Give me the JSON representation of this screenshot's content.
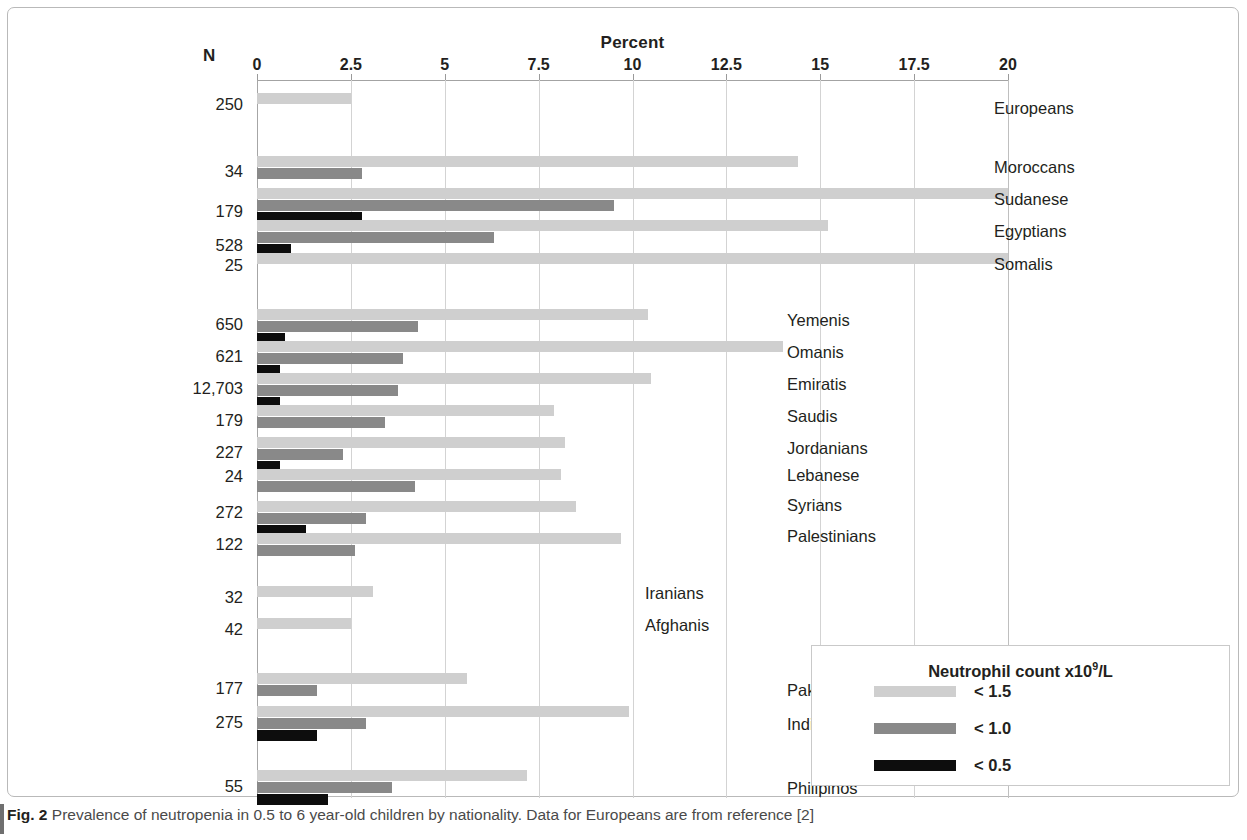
{
  "figure": {
    "caption_label": "Fig. 2",
    "caption_text": "Prevalence of neutropenia in 0.5 to 6 year-old children by nationality. Data for Europeans are from reference [2]"
  },
  "axis": {
    "title": "Percent",
    "n_header": "N",
    "tick_labels": [
      "0",
      "2.5",
      "5",
      "7.5",
      "10",
      "12.5",
      "15",
      "17.5",
      "20"
    ]
  },
  "legend": {
    "title_prefix": "Neutrophil count x10",
    "title_sup": "9",
    "title_suffix": "/L",
    "entries": [
      {
        "label": "< 1.5",
        "color": "#cfcfcf",
        "swatch_class": "sw15"
      },
      {
        "label": "< 1.0",
        "color": "#898989",
        "swatch_class": "sw10"
      },
      {
        "label": "< 0.5",
        "color": "#0d0d0d",
        "swatch_class": "sw05"
      }
    ]
  },
  "chart_data": {
    "type": "bar",
    "orientation": "horizontal",
    "title": "Prevalence of neutropenia in 0.5 to 6 year-old children by nationality",
    "xlabel": "Percent",
    "ylabel": "N",
    "xlim": [
      0,
      20
    ],
    "xticks": [
      0,
      2.5,
      5,
      7.5,
      10,
      12.5,
      15,
      17.5,
      20
    ],
    "grid": "vertical",
    "legend_position": "bottom-right",
    "series_names": [
      "< 1.5",
      "< 1.0",
      "< 0.5"
    ],
    "series_colors": [
      "#cfcfcf",
      "#898989",
      "#0d0d0d"
    ],
    "categories": [
      "Europeans",
      "Moroccans",
      "Sudanese",
      "Egyptians",
      "Somalis",
      "Yemenis",
      "Omanis",
      "Emiratis",
      "Saudis",
      "Jordanians",
      "Lebanese",
      "Syrians",
      "Palestinians",
      "Iranians",
      "Afghanis",
      "Pakistanis",
      "Indians",
      "Philipinos"
    ],
    "n_values": [
      "250",
      "34",
      "179",
      "528",
      "25",
      "650",
      "621",
      "12,703",
      "179",
      "227",
      "24",
      "272",
      "122",
      "32",
      "42",
      "177",
      "275",
      "55"
    ],
    "series": [
      {
        "name": "< 1.5",
        "values": [
          2.5,
          14.4,
          20.0,
          15.2,
          20.0,
          10.4,
          14.0,
          10.5,
          7.9,
          8.2,
          8.1,
          8.5,
          9.7,
          3.1,
          2.5,
          5.6,
          9.9,
          7.2
        ]
      },
      {
        "name": "< 1.0",
        "values": [
          0.0,
          2.8,
          9.5,
          6.3,
          0.0,
          4.3,
          3.9,
          3.75,
          3.4,
          2.3,
          4.2,
          2.9,
          2.6,
          0.0,
          0.0,
          1.6,
          2.9,
          3.6
        ]
      },
      {
        "name": "< 0.5",
        "values": [
          0.0,
          0.0,
          2.8,
          0.9,
          0.0,
          0.75,
          0.6,
          0.6,
          0.0,
          0.6,
          0.0,
          1.3,
          0.0,
          0.0,
          0.0,
          0.0,
          1.6,
          1.9
        ]
      }
    ],
    "groups": [
      {
        "start": 0,
        "count": 5
      },
      {
        "start": 5,
        "count": 8
      },
      {
        "start": 13,
        "count": 2
      },
      {
        "start": 15,
        "count": 3
      }
    ]
  },
  "row_layout": {
    "row_top": [
      85,
      148,
      180,
      212,
      245,
      301,
      333,
      365,
      397,
      429,
      461,
      493,
      525,
      578,
      610,
      665,
      698,
      762
    ],
    "n_label_top": [
      87,
      154,
      194,
      228,
      248,
      307,
      339,
      371,
      403,
      435,
      459,
      495,
      527,
      580,
      612,
      671,
      705,
      769
    ],
    "cat_label_left": [
      986,
      986,
      986,
      986,
      986,
      779,
      779,
      779,
      779,
      779,
      779,
      779,
      779,
      637,
      637,
      779,
      779,
      779
    ],
    "cat_label_top": [
      91,
      150,
      182,
      214,
      247,
      303,
      335,
      367,
      399,
      431,
      458,
      488,
      519,
      576,
      608,
      673,
      707,
      771
    ]
  }
}
